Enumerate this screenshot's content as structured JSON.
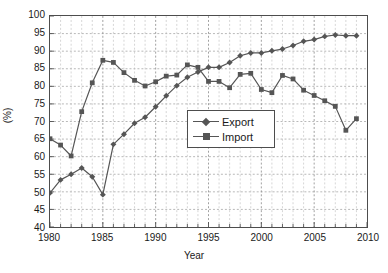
{
  "chart_data": {
    "type": "line",
    "title": "",
    "xlabel": "Year",
    "ylabel": "(%)",
    "xlim": [
      1980,
      2010
    ],
    "ylim": [
      40,
      100
    ],
    "y_ticks": [
      40,
      45,
      50,
      55,
      60,
      65,
      70,
      75,
      80,
      85,
      90,
      95,
      100
    ],
    "x_ticks": [
      1980,
      1985,
      1990,
      1995,
      2000,
      2005,
      2010
    ],
    "x_minor_step": 1,
    "grid": "dashed-both",
    "legend_position": "center",
    "x": [
      1980,
      1981,
      1982,
      1983,
      1984,
      1985,
      1986,
      1987,
      1988,
      1989,
      1990,
      1991,
      1992,
      1993,
      1994,
      1995,
      1996,
      1997,
      1998,
      1999,
      2000,
      2001,
      2002,
      2003,
      2004,
      2005,
      2006,
      2007,
      2008,
      2009
    ],
    "series": [
      {
        "name": "Export",
        "marker": "diamond",
        "color": "#555555",
        "values": [
          49.7,
          53.4,
          55.0,
          56.8,
          54.3,
          49.2,
          63.5,
          66.4,
          69.5,
          71.2,
          74.2,
          77.3,
          80.2,
          82.6,
          84.1,
          85.4,
          85.4,
          86.8,
          88.7,
          89.5,
          89.5,
          90.1,
          90.6,
          91.6,
          92.8,
          93.3,
          94.2,
          94.6,
          94.4,
          94.4
        ]
      },
      {
        "name": "Import",
        "marker": "square",
        "color": "#555555",
        "values": [
          65.1,
          63.3,
          60.2,
          72.8,
          81.0,
          87.4,
          86.8,
          83.9,
          81.7,
          80.1,
          81.3,
          82.9,
          83.2,
          86.1,
          85.4,
          81.4,
          81.4,
          79.6,
          83.4,
          83.7,
          79.1,
          78.2,
          83.1,
          82.1,
          78.9,
          77.4,
          75.9,
          74.3,
          67.5,
          70.8
        ]
      }
    ]
  },
  "legend": {
    "entries": [
      {
        "label": "Export"
      },
      {
        "label": "Import"
      }
    ]
  }
}
